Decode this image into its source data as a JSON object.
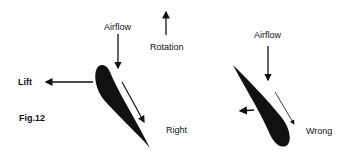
{
  "figure": {
    "caption": "Fig.12",
    "right_panel": {
      "label": "Right",
      "airflow_label": "Airflow",
      "lift_label": "Lift",
      "rotation_label": "Rotation"
    },
    "wrong_panel": {
      "label": "Wrong",
      "airflow_label": "Airflow"
    },
    "colors": {
      "ink": "#111111",
      "background": "#ffffff"
    }
  }
}
